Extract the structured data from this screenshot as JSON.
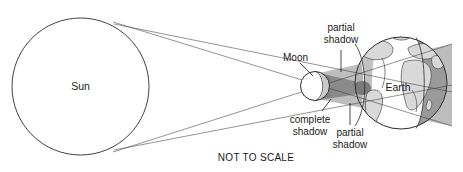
{
  "diagram": {
    "note": "NOT TO SCALE",
    "labels": {
      "sun": "Sun",
      "moon": "Moon",
      "earth": "Earth",
      "partial_shadow_top": "partial\nshadow",
      "partial_shadow_top_line1": "partial",
      "partial_shadow_top_line2": "shadow",
      "complete_shadow_line1": "complete",
      "complete_shadow_line2": "shadow",
      "partial_shadow_bottom_line1": "partial",
      "partial_shadow_bottom_line2": "shadow"
    },
    "bodies": [
      {
        "name": "sun",
        "label": "Sun",
        "cx": 80.5,
        "cy": 86.5,
        "r": 68.5,
        "fill": "#ffffff"
      },
      {
        "name": "moon",
        "label": "Moon",
        "cx": 315,
        "cy": 86,
        "r": 14.5,
        "fill": "#ffffff"
      },
      {
        "name": "earth",
        "label": "Earth",
        "cx": 401,
        "cy": 83,
        "r": 46,
        "fill": "#ffffff"
      }
    ],
    "shadow_regions": [
      {
        "name": "complete-shadow",
        "alias": "umbra",
        "color": "#8a8a8a"
      },
      {
        "name": "partial-shadow",
        "alias": "penumbra",
        "color": "#bdbdbd"
      },
      {
        "name": "earth-night",
        "color": "#9a9a9a"
      },
      {
        "name": "landmass",
        "color": "#d9d9d9"
      }
    ],
    "colors": {
      "background": "#ffffff",
      "outline": "#2b2b2b",
      "ray": "#3a3a3a",
      "text": "#1a1a1a",
      "umbra": "#8a8a8a",
      "penumbra": "#bdbdbd",
      "earth_shaded": "#9a9a9a",
      "earth_land": "#d9d9d9"
    },
    "ray_count": 4,
    "tangent_points": [
      {
        "name": "sun-top-tangent",
        "x": 113,
        "y": 22
      },
      {
        "name": "sun-bottom-tangent",
        "x": 113,
        "y": 152
      }
    ]
  }
}
